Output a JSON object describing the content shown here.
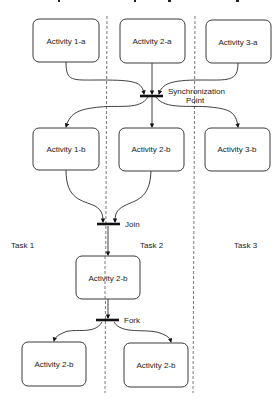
{
  "diagram": {
    "title": "",
    "lanes": [
      {
        "id": "task1",
        "label": "Task 1"
      },
      {
        "id": "task2",
        "label": "Task 2"
      },
      {
        "id": "task3",
        "label": "Task 3"
      }
    ],
    "activities": [
      {
        "id": "a1a",
        "label": "Activity 1-a",
        "lane": "task1"
      },
      {
        "id": "a2a",
        "label": "Activity 2-a",
        "lane": "task2"
      },
      {
        "id": "a3a",
        "label": "Activity 3-a",
        "lane": "task3"
      },
      {
        "id": "a1b",
        "label": "Activity 1-b",
        "lane": "task1"
      },
      {
        "id": "a2b",
        "label": "Activity 2-b",
        "lane": "task2"
      },
      {
        "id": "a3b",
        "label": "Activity 3-b",
        "lane": "task3"
      },
      {
        "id": "a2b_mid",
        "label": "Activity 2-b",
        "lane": "task2"
      },
      {
        "id": "a2b_left",
        "label": "Activity 2-b",
        "lane": "task1"
      },
      {
        "id": "a2b_right",
        "label": "Activity 2-b",
        "lane": "task2"
      }
    ],
    "bars": [
      {
        "id": "sync",
        "label_line1": "Synchronization",
        "label_line2": "Point"
      },
      {
        "id": "join",
        "label_line1": "Join"
      },
      {
        "id": "fork",
        "label_line1": "Fork"
      }
    ],
    "edges": [
      {
        "from": "a1a",
        "to": "sync"
      },
      {
        "from": "a2a",
        "to": "sync"
      },
      {
        "from": "a3a",
        "to": "sync"
      },
      {
        "from": "sync",
        "to": "a1b"
      },
      {
        "from": "sync",
        "to": "a2b"
      },
      {
        "from": "sync",
        "to": "a3b"
      },
      {
        "from": "a1b",
        "to": "join"
      },
      {
        "from": "a2b",
        "to": "join"
      },
      {
        "from": "join",
        "to": "a2b_mid"
      },
      {
        "from": "a2b_mid",
        "to": "fork"
      },
      {
        "from": "fork",
        "to": "a2b_left"
      },
      {
        "from": "fork",
        "to": "a2b_right"
      }
    ]
  }
}
